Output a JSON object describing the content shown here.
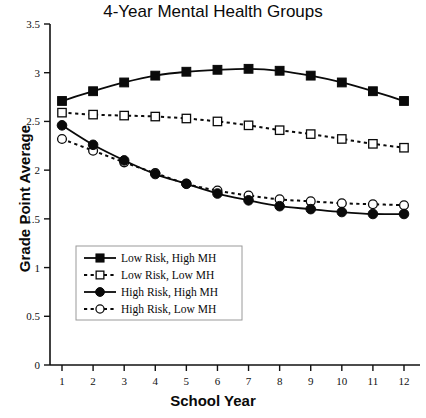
{
  "chart_data": {
    "type": "line",
    "title": "4-Year Mental Health Groups",
    "xlabel": "School Year",
    "ylabel": "Grade Point Average",
    "x": [
      1,
      2,
      3,
      4,
      5,
      6,
      7,
      8,
      9,
      10,
      11,
      12
    ],
    "xtick_labels": [
      "1",
      "2",
      "3",
      "4",
      "5",
      "6",
      "7",
      "8",
      "9",
      "10",
      "11",
      "12"
    ],
    "ytick_labels": [
      "0",
      "0.5",
      "1",
      "1.5",
      "2",
      "2.5",
      "3",
      "3.5"
    ],
    "yticks": [
      0,
      0.5,
      1,
      1.5,
      2,
      2.5,
      3,
      3.5
    ],
    "ylim": [
      0,
      3.5
    ],
    "xlim": [
      1,
      12
    ],
    "grid": false,
    "legend_position": "lower-left-inside",
    "series": [
      {
        "name": "Low Risk, High MH",
        "marker": "filled-square",
        "line": "solid",
        "color": "#0a0a0a",
        "values": [
          2.71,
          2.81,
          2.9,
          2.97,
          3.01,
          3.03,
          3.04,
          3.02,
          2.97,
          2.9,
          2.81,
          2.71
        ]
      },
      {
        "name": "Low Risk, Low MH",
        "marker": "open-square",
        "line": "dashed",
        "color": "#0a0a0a",
        "values": [
          2.59,
          2.57,
          2.56,
          2.55,
          2.53,
          2.5,
          2.46,
          2.41,
          2.37,
          2.32,
          2.27,
          2.23
        ]
      },
      {
        "name": "High Risk, High MH",
        "marker": "filled-circle",
        "line": "solid",
        "color": "#0a0a0a",
        "values": [
          2.46,
          2.26,
          2.1,
          1.96,
          1.86,
          1.76,
          1.69,
          1.63,
          1.6,
          1.57,
          1.55,
          1.55
        ]
      },
      {
        "name": "High Risk, Low MH",
        "marker": "open-circle",
        "line": "dashed",
        "color": "#0a0a0a",
        "values": [
          2.32,
          2.2,
          2.08,
          1.97,
          1.86,
          1.79,
          1.74,
          1.7,
          1.68,
          1.66,
          1.65,
          1.64
        ]
      }
    ]
  },
  "legend": {
    "items": [
      {
        "label": "Low Risk, High MH",
        "marker": "filled-square",
        "line": "solid"
      },
      {
        "label": "Low Risk, Low MH",
        "marker": "open-square",
        "line": "dashed"
      },
      {
        "label": "High Risk, High MH",
        "marker": "filled-circle",
        "line": "solid"
      },
      {
        "label": "High Risk, Low MH",
        "marker": "open-circle",
        "line": "dashed"
      }
    ]
  }
}
